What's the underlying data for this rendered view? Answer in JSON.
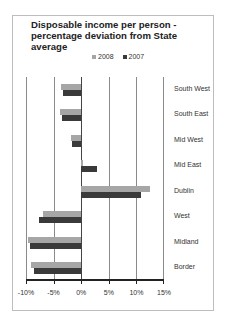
{
  "chart_data": {
    "type": "bar",
    "orientation": "horizontal",
    "title": "Disposable income per person - percentage deviation from State average",
    "categories": [
      "South West",
      "South East",
      "Mid West",
      "Mid East",
      "Dublin",
      "West",
      "Midland",
      "Border"
    ],
    "series": [
      {
        "name": "2008",
        "color": "#a6a6a6",
        "values": [
          -3.6,
          -3.8,
          -1.8,
          0.4,
          12.4,
          -6.9,
          -9.6,
          -9.1
        ]
      },
      {
        "name": "2007",
        "color": "#3a3a3a",
        "values": [
          -3.3,
          -3.5,
          -1.6,
          2.9,
          10.9,
          -7.6,
          -9.3,
          -8.5
        ]
      }
    ],
    "xlabel": "",
    "ylabel": "",
    "xlim": [
      -10,
      15
    ],
    "xticks": [
      "-10%",
      "-5%",
      "0%",
      "5%",
      "10%",
      "15%"
    ],
    "grid": true,
    "legend_position": "top"
  },
  "title_lines": [
    "Disposable income per person -",
    "percentage deviation from State",
    "average"
  ],
  "legend": [
    {
      "label": "2008",
      "color": "#a6a6a6"
    },
    {
      "label": "2007",
      "color": "#3a3a3a"
    }
  ]
}
